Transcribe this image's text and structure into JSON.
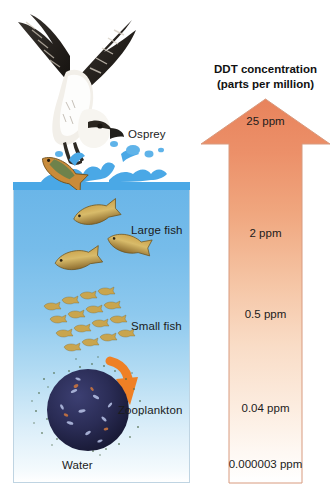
{
  "diagram": {
    "title": "DDT concentration (parts per million)",
    "ddt_panel": {
      "title_line1": "DDT concentration",
      "title_line2": "(parts per million)",
      "arrow_direction": "up",
      "arrow_color_top": "#e8835c",
      "arrow_color_bottom": "#ffffff",
      "levels": [
        {
          "value": "25 ppm",
          "organism": "Osprey"
        },
        {
          "value": "2 ppm",
          "organism": "Large fish"
        },
        {
          "value": "0.5 ppm",
          "organism": "Small fish"
        },
        {
          "value": "0.04 ppm",
          "organism": "Zooplankton"
        },
        {
          "value": "0.000003 ppm",
          "organism": "Water"
        }
      ]
    },
    "food_chain": {
      "labels": [
        {
          "name": "Osprey"
        },
        {
          "name": "Large fish"
        },
        {
          "name": "Small fish"
        },
        {
          "name": "Zooplankton"
        },
        {
          "name": "Water"
        }
      ],
      "water_color_top": "#69b5e8",
      "water_color_bottom": "#ffffff",
      "arrow_accent_color": "#ef8025"
    }
  }
}
